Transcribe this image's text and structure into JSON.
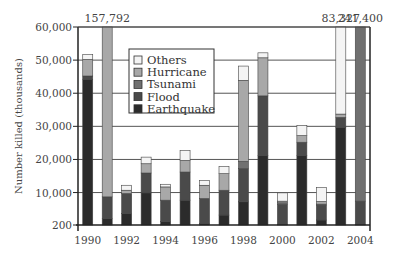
{
  "chart_data": {
    "type": "bar",
    "stacked": true,
    "title": "",
    "xlabel": "",
    "ylabel": "Number killed (thousands)",
    "ylim": [
      200,
      60000
    ],
    "y_ticks": [
      200,
      10000,
      20000,
      30000,
      40000,
      50000,
      60000
    ],
    "y_tick_labels": [
      "200",
      "10,000",
      "20,000",
      "30,000",
      "40,000",
      "50,000",
      "60,000"
    ],
    "x_tick_labels": [
      "1990",
      "1992",
      "1994",
      "1996",
      "1998",
      "2000",
      "2002",
      "2004"
    ],
    "grid": true,
    "legend_position": "upper-center",
    "categories": [
      "1990",
      "1991",
      "1992",
      "1993",
      "1994",
      "1995",
      "1996",
      "1997",
      "1998",
      "1999",
      "2000",
      "2001",
      "2002",
      "2003",
      "2004"
    ],
    "series": [
      {
        "name": "Earthquake",
        "color": "#2b2b2b",
        "values": [
          44000,
          2000,
          3500,
          9700,
          1000,
          7500,
          500,
          3000,
          7000,
          21000,
          200,
          21000,
          1500,
          29500,
          200
        ]
      },
      {
        "name": "Flood",
        "color": "#4a4a4a",
        "values": [
          1000,
          6500,
          6000,
          6000,
          6500,
          8500,
          7500,
          7500,
          10000,
          18000,
          6000,
          4000,
          4500,
          3000,
          7000
        ]
      },
      {
        "name": "Tsunami",
        "color": "#707070",
        "values": [
          0,
          0,
          0,
          0,
          0,
          0,
          0,
          0,
          2200,
          0,
          500,
          0,
          300,
          0,
          234000
        ]
      },
      {
        "name": "Hurricane",
        "color": "#a8a8a8",
        "values": [
          5000,
          149000,
          1000,
          2800,
          4000,
          3500,
          4000,
          5000,
          24500,
          11500,
          500,
          2000,
          800,
          1000,
          0
        ]
      },
      {
        "name": "Others",
        "color": "#f4f4f4",
        "values": [
          1500,
          292,
          1500,
          2000,
          800,
          3000,
          1500,
          2200,
          4300,
          1500,
          2500,
          3000,
          4200,
          49827,
          200
        ]
      }
    ],
    "annotations": [
      {
        "category": "1991",
        "label": "157,792"
      },
      {
        "category": "2003",
        "label": "83,327"
      },
      {
        "category": "2004",
        "label": "241,400"
      }
    ]
  },
  "legend": {
    "items": [
      {
        "label": "Others",
        "color": "#f4f4f4"
      },
      {
        "label": "Hurricane",
        "color": "#a8a8a8"
      },
      {
        "label": "Tsunami",
        "color": "#707070"
      },
      {
        "label": "Flood",
        "color": "#4a4a4a"
      },
      {
        "label": "Earthquake",
        "color": "#2b2b2b"
      }
    ]
  }
}
